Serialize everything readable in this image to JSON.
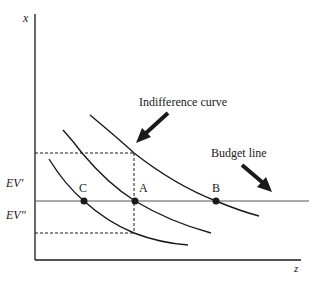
{
  "axes": {
    "y_label": "x",
    "x_label": "z"
  },
  "y_ticks": {
    "ev_prime": "EV′",
    "ev_double_prime": "EV″"
  },
  "points": {
    "a": "A",
    "b": "B",
    "c": "C"
  },
  "annotations": {
    "indifference_curve": "Indifference curve",
    "budget_line": "Budget line"
  },
  "colors": {
    "ink": "#1a1a1a",
    "budget_line": "#555555",
    "background": "#ffffff"
  }
}
